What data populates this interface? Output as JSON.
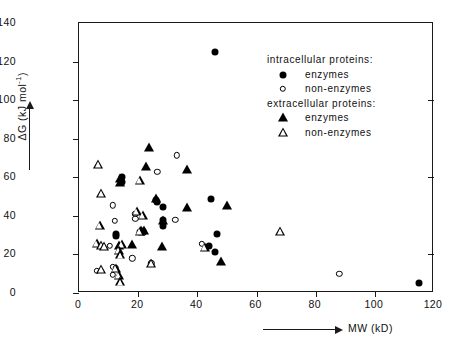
{
  "chart_data": {
    "type": "scatter",
    "title": "",
    "xlabel": "MW (kD)",
    "ylabel": "ΔG (kJ mol⁻¹)",
    "xlim": [
      0,
      120
    ],
    "ylim": [
      0,
      140
    ],
    "xticks": [
      0,
      20,
      40,
      60,
      80,
      100,
      120
    ],
    "yticks": [
      0,
      20,
      40,
      60,
      80,
      100,
      120,
      140
    ],
    "grid": false,
    "legend_position": "upper-right-inside",
    "series": [
      {
        "name": "intracellular proteins: enzymes",
        "marker": "circle-filled",
        "points": [
          [
            46,
            125
          ],
          [
            14.5,
            60
          ],
          [
            14.5,
            57.5
          ],
          [
            12.5,
            30.5
          ],
          [
            12.5,
            29.5
          ],
          [
            28.5,
            44.5
          ],
          [
            28.5,
            38
          ],
          [
            28.5,
            35
          ],
          [
            26,
            48
          ],
          [
            26.5,
            47
          ],
          [
            44.5,
            49
          ],
          [
            46.5,
            30.5
          ],
          [
            44,
            24.5
          ],
          [
            46,
            21.5
          ],
          [
            115,
            5
          ],
          [
            21.5,
            32
          ],
          [
            20.5,
            31.5
          ]
        ]
      },
      {
        "name": "intracellular proteins: non-enzymes",
        "marker": "circle-open",
        "points": [
          [
            33,
            71.5
          ],
          [
            26.5,
            63
          ],
          [
            11.5,
            45.5
          ],
          [
            12,
            37.5
          ],
          [
            19,
            41
          ],
          [
            19,
            38.5
          ],
          [
            32.5,
            38
          ],
          [
            10.5,
            24.5
          ],
          [
            18,
            18
          ],
          [
            6,
            11.5
          ],
          [
            11.5,
            13.5
          ],
          [
            12.5,
            13
          ],
          [
            11.5,
            9.5
          ],
          [
            24.5,
            15.5
          ],
          [
            41.5,
            25.5
          ],
          [
            88,
            10
          ],
          [
            22,
            31.5
          ]
        ]
      },
      {
        "name": "extracellular proteins: enzymes",
        "marker": "tri-filled",
        "points": [
          [
            23.5,
            75
          ],
          [
            22.5,
            65.5
          ],
          [
            14,
            59
          ],
          [
            14,
            57
          ],
          [
            36.5,
            64
          ],
          [
            26,
            48.5
          ],
          [
            28.5,
            37.5
          ],
          [
            36.5,
            44
          ],
          [
            50,
            45
          ],
          [
            28,
            24
          ],
          [
            18,
            25
          ],
          [
            13.5,
            24.5
          ],
          [
            48,
            16
          ],
          [
            21,
            32
          ],
          [
            22,
            32
          ]
        ]
      },
      {
        "name": "extracellular proteins: non-enzymes",
        "marker": "tri-open",
        "points": [
          [
            6.5,
            66.5
          ],
          [
            7.5,
            51.5
          ],
          [
            20.5,
            58
          ],
          [
            7,
            35
          ],
          [
            19.5,
            42
          ],
          [
            21.5,
            40
          ],
          [
            6,
            25.5
          ],
          [
            7.5,
            24.5
          ],
          [
            8.5,
            24
          ],
          [
            14.5,
            25
          ],
          [
            13.5,
            22
          ],
          [
            14,
            19.5
          ],
          [
            7.5,
            12
          ],
          [
            12.5,
            12.5
          ],
          [
            13.5,
            9
          ],
          [
            14,
            5.5
          ],
          [
            24.5,
            15
          ],
          [
            68,
            31.5
          ],
          [
            20.5,
            31.5
          ],
          [
            42.5,
            23.5
          ]
        ]
      }
    ]
  },
  "axes": {
    "y_title": "ΔG  (kJ mol",
    "y_title_sup": "-1",
    "y_title_close": ")",
    "x_title": "MW  (kD)",
    "x_tick_labels": [
      "0",
      "20",
      "40",
      "60",
      "80",
      "100",
      "120"
    ],
    "y_tick_labels": [
      "0",
      "20",
      "40",
      "60",
      "80",
      "100",
      "120",
      "140"
    ]
  },
  "legend": {
    "heading_intracellular": "intracellular proteins:",
    "heading_extracellular": "extracellular proteins:",
    "intra_enzymes": "enzymes",
    "intra_non_enzymes": "non-enzymes",
    "extra_enzymes": "enzymes",
    "extra_non_enzymes": "non-enzymes"
  },
  "colors": {
    "foreground": "#000000",
    "background": "#ffffff",
    "axis": "#1a1a1a"
  }
}
